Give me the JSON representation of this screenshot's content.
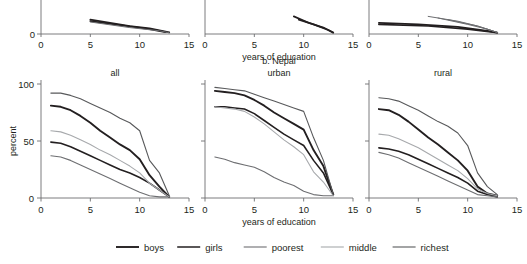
{
  "figure": {
    "group_title": "b. Nepal",
    "y_axis_label": "percent",
    "x_axis_label": "years of education",
    "x_axis_label_top": "years of education",
    "y_ticks": [
      0,
      50,
      100
    ],
    "x_ticks": [
      0,
      5,
      10,
      15
    ]
  },
  "legend": {
    "items": [
      {
        "label": "boys",
        "color": "#231f20",
        "width": 1.9
      },
      {
        "label": "girls",
        "color": "#231f20",
        "width": 1.5
      },
      {
        "label": "poorest",
        "color": "#6d6e71",
        "width": 1.1
      },
      {
        "label": "middle",
        "color": "#a7a9ac",
        "width": 1.1
      },
      {
        "label": "richest",
        "color": "#58595b",
        "width": 1.1
      }
    ]
  },
  "panels": [
    {
      "name": "all",
      "title": "all"
    },
    {
      "name": "urban",
      "title": "urban"
    },
    {
      "name": "rural",
      "title": "rural"
    }
  ],
  "chart_data": {
    "type": "line",
    "title": "b. Nepal",
    "xlabel": "years of education",
    "ylabel": "percent",
    "xlim": [
      0,
      15
    ],
    "ylim": [
      0,
      100
    ],
    "xticks": [
      0,
      5,
      10,
      15
    ],
    "yticks": [
      0,
      50,
      100
    ],
    "grid": false,
    "legend_position": "bottom",
    "legend_entries": [
      "boys",
      "girls",
      "poorest",
      "middle",
      "richest"
    ],
    "panels": [
      {
        "panel": "all",
        "x": [
          1,
          2,
          3,
          4,
          5,
          6,
          7,
          8,
          9,
          10,
          11,
          12,
          13
        ],
        "series": [
          {
            "name": "boys",
            "color": "#231f20",
            "values": [
              81,
              80,
              77,
              72,
              66,
              59,
              53,
              47,
              42,
              34,
              20,
              10,
              1
            ]
          },
          {
            "name": "girls",
            "color": "#231f20",
            "values": [
              49,
              48,
              45,
              41,
              37,
              33,
              29,
              25,
              22,
              18,
              13,
              7,
              1
            ]
          },
          {
            "name": "poorest",
            "color": "#6d6e71",
            "values": [
              37,
              36,
              33,
              29,
              25,
              21,
              17,
              13,
              9,
              5,
              2,
              1,
              1
            ]
          },
          {
            "name": "middle",
            "color": "#a7a9ac",
            "values": [
              59,
              58,
              55,
              51,
              47,
              42,
              38,
              33,
              28,
              22,
              13,
              7,
              1
            ]
          },
          {
            "name": "richest",
            "color": "#58595b",
            "values": [
              92,
              92,
              90,
              87,
              83,
              79,
              75,
              70,
              66,
              59,
              33,
              22,
              2
            ]
          }
        ]
      },
      {
        "panel": "urban",
        "x": [
          1,
          2,
          3,
          4,
          5,
          6,
          7,
          8,
          9,
          10,
          11,
          12,
          13
        ],
        "series": [
          {
            "name": "boys",
            "color": "#231f20",
            "values": [
              94,
              93,
              92,
              90,
              86,
              81,
              75,
              70,
              65,
              60,
              42,
              28,
              3
            ]
          },
          {
            "name": "girls",
            "color": "#231f20",
            "values": [
              80,
              80,
              79,
              78,
              74,
              68,
              62,
              56,
              51,
              46,
              33,
              22,
              3
            ]
          },
          {
            "name": "poorest",
            "color": "#6d6e71",
            "values": [
              36,
              34,
              31,
              29,
              27,
              23,
              18,
              14,
              11,
              6,
              3,
              2,
              2
            ]
          },
          {
            "name": "middle",
            "color": "#a7a9ac",
            "values": [
              80,
              79,
              78,
              76,
              71,
              65,
              58,
              51,
              45,
              38,
              23,
              14,
              2
            ]
          },
          {
            "name": "richest",
            "color": "#58595b",
            "values": [
              97,
              96,
              95,
              94,
              91,
              88,
              85,
              82,
              79,
              76,
              53,
              33,
              3
            ]
          }
        ]
      },
      {
        "panel": "rural",
        "x": [
          1,
          2,
          3,
          4,
          5,
          6,
          7,
          8,
          9,
          10,
          11,
          12,
          13
        ],
        "series": [
          {
            "name": "boys",
            "color": "#231f20",
            "values": [
              78,
              77,
              73,
              67,
              60,
              53,
              47,
              40,
              33,
              24,
              10,
              4,
              2
            ]
          },
          {
            "name": "girls",
            "color": "#231f20",
            "values": [
              44,
              43,
              41,
              38,
              34,
              30,
              26,
              22,
              18,
              13,
              6,
              3,
              1
            ]
          },
          {
            "name": "poorest",
            "color": "#6d6e71",
            "values": [
              40,
              38,
              35,
              31,
              27,
              23,
              19,
              15,
              11,
              7,
              3,
              2,
              1
            ]
          },
          {
            "name": "middle",
            "color": "#a7a9ac",
            "values": [
              56,
              55,
              52,
              48,
              44,
              39,
              34,
              29,
              24,
              17,
              8,
              4,
              2
            ]
          },
          {
            "name": "richest",
            "color": "#58595b",
            "values": [
              88,
              87,
              85,
              81,
              77,
              72,
              67,
              63,
              57,
              46,
              22,
              10,
              3
            ]
          }
        ]
      }
    ],
    "top_cropped_panels": {
      "note": "bottom edge of panel a, three panels, axis 0-15",
      "x_ticks": [
        0,
        5,
        10,
        15
      ],
      "y_ticks": [
        0
      ]
    }
  }
}
